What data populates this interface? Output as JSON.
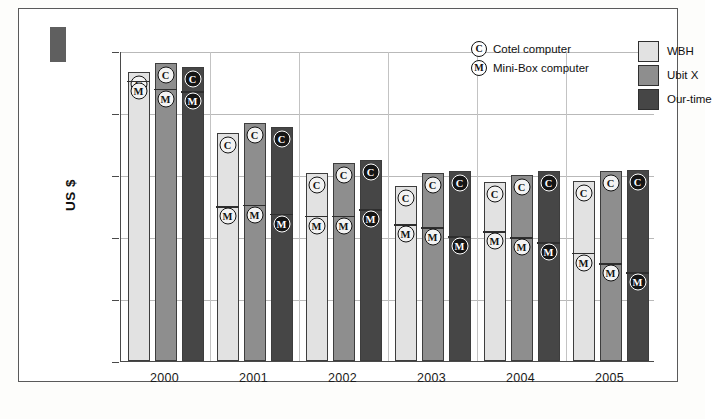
{
  "chart_data": {
    "type": "bar",
    "title": "",
    "xlabel": "",
    "ylabel": "US $",
    "ylim": [
      0,
      2500
    ],
    "ytick_values": [
      0,
      500,
      1000,
      1500,
      2000,
      2500
    ],
    "ytick_labels": [
      "0",
      "500",
      "1000",
      "1500",
      "2000",
      "2500"
    ],
    "grid": true,
    "categories": [
      "2000",
      "2001",
      "2002",
      "2003",
      "2004",
      "2005"
    ],
    "legend_position": "top-right",
    "series": [
      {
        "name": "WBH",
        "color": "#e2e2e2",
        "marker_series": "Cotel computer",
        "values": [
          2330,
          1840,
          1520,
          1410,
          1440,
          1450
        ]
      },
      {
        "name": "Ubit X",
        "color": "#8e8e8e",
        "marker_series": "Cotel computer",
        "values": [
          2400,
          1920,
          1600,
          1520,
          1500,
          1530
        ]
      },
      {
        "name": "Our-time",
        "color": "#464646",
        "marker_series": "Cotel computer",
        "values": [
          2370,
          1885,
          1625,
          1530,
          1530,
          1540
        ]
      }
    ],
    "secondary_series": [
      {
        "name": "WBH",
        "marker_series": "Mini-Box computer",
        "values": [
          2270,
          1255,
          1180,
          1110,
          1055,
          880
        ]
      },
      {
        "name": "Ubit X",
        "marker_series": "Mini-Box computer",
        "values": [
          2205,
          1270,
          1180,
          1085,
          1005,
          795
        ]
      },
      {
        "name": "Our-time",
        "marker_series": "Mini-Box computer",
        "values": [
          2185,
          1195,
          1230,
          1015,
          965,
          725
        ]
      }
    ],
    "marker_legend": [
      {
        "glyph": "C",
        "label": "Cotel computer"
      },
      {
        "glyph": "M",
        "label": "Mini-Box computer"
      }
    ],
    "swatch_legend": [
      {
        "label": "WBH",
        "color": "#e2e2e2"
      },
      {
        "label": "Ubit X",
        "color": "#8e8e8e"
      },
      {
        "label": "Our-time",
        "color": "#464646"
      }
    ],
    "colors": {
      "wbh": "#e2e2e2",
      "ubit_x": "#8e8e8e",
      "our_time": "#464646",
      "axis": "#4a4a4a",
      "grid": "#b9b9b9",
      "frame": "#5a5a5a"
    }
  }
}
